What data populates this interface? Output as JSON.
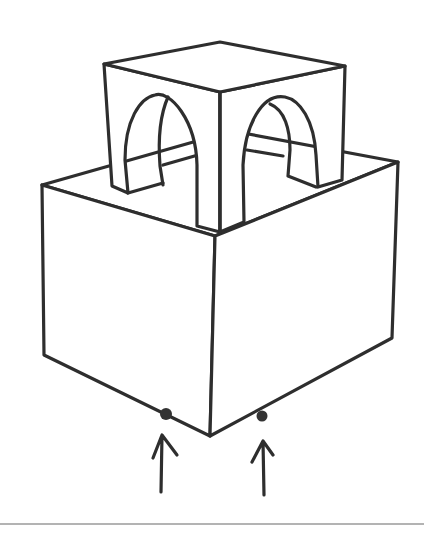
{
  "diagram": {
    "colors": {
      "ink": "#2e2e2e",
      "background": "#ffffff",
      "rule": "#9a9a9a"
    },
    "lower_box": {
      "top_face": [
        [
          42,
          185
        ],
        [
          215,
          235
        ],
        [
          398,
          162
        ],
        [
          232,
          130
        ]
      ],
      "front_left_bottom": [
        [
          44,
          355
        ],
        [
          210,
          435
        ]
      ],
      "front_right_bottom": [
        [
          210,
          435
        ],
        [
          392,
          338
        ]
      ]
    },
    "upper_cube": {
      "top_face": [
        [
          104,
          63
        ],
        [
          220,
          92
        ],
        [
          345,
          65
        ],
        [
          220,
          42
        ]
      ],
      "front_corner_x": 220
    },
    "supports": [
      {
        "name": "left-support",
        "point": [
          166,
          414
        ],
        "arrow_from": [
          161,
          492
        ],
        "arrow_to": [
          161,
          435
        ]
      },
      {
        "name": "right-support",
        "point": [
          262,
          416
        ],
        "arrow_from": [
          264,
          495
        ],
        "arrow_to": [
          264,
          441
        ]
      }
    ],
    "bottom_rule": {
      "x1": 0,
      "x2": 424,
      "y": 524
    }
  }
}
